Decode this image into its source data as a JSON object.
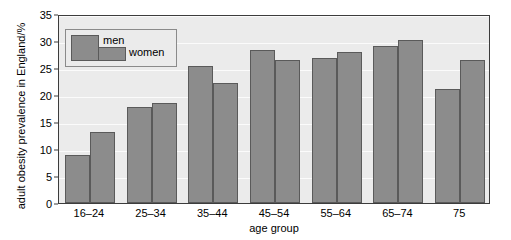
{
  "chart_data": {
    "type": "bar",
    "title": "",
    "subtitle": "",
    "xlabel": "age group",
    "ylabel": "adult obesity prevalence in England/%",
    "categories": [
      "16–24",
      "25–34",
      "35–44",
      "45–54",
      "55–64",
      "65–74",
      "75"
    ],
    "series": [
      {
        "name": "men",
        "values": [
          8.8,
          17.7,
          25.4,
          28.4,
          26.9,
          29.1,
          21.1
        ]
      },
      {
        "name": "women",
        "values": [
          13.2,
          18.5,
          22.2,
          26.5,
          28.0,
          30.2,
          26.5
        ]
      }
    ],
    "ylim": [
      0,
      35
    ],
    "yticks": [
      0,
      5,
      10,
      15,
      20,
      25,
      30,
      35
    ],
    "ytick_labels": [
      "0",
      "5",
      "10",
      "15",
      "20",
      "25",
      "30",
      "35"
    ],
    "grid": "horizontal-white-on-gray",
    "legend_position": "upper-left-inside",
    "colors": {
      "bar_fill": "#8c8c8c",
      "bar_edge": "#5a5a5a",
      "plot_background": "#ebebeb",
      "gridline": "#fbfbfb",
      "axis": "#3c3c3c",
      "figure_background": "#ffffff",
      "text": "#000000"
    }
  }
}
